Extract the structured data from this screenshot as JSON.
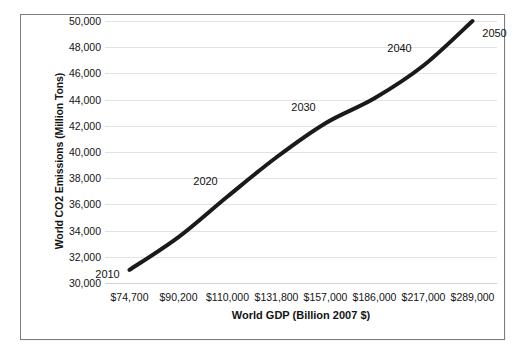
{
  "figure": {
    "background_color": "#ffffff",
    "frame_border_color": "#7d7d7d",
    "gridline_color": "#e2e2e2",
    "series_color": "#1a1a1a"
  },
  "chart_data": {
    "type": "line",
    "title": "",
    "xlabel": "World GDP (Billion 2007 $)",
    "ylabel": "World CO2 Emissions (Million Tons)",
    "x_tick_labels": [
      "$74,700",
      "$90,200",
      "$110,000",
      "$131,800",
      "$157,000",
      "$186,000",
      "$217,000",
      "$289,000"
    ],
    "x": [
      74700,
      90200,
      110000,
      131800,
      157000,
      186000,
      217000,
      289000
    ],
    "y_tick_labels": [
      "50,000",
      "48,000",
      "46,000",
      "44,000",
      "42,000",
      "40,000",
      "38,000",
      "36,000",
      "34,000",
      "32,000",
      "30,000"
    ],
    "y_ticks": [
      50000,
      48000,
      46000,
      44000,
      42000,
      40000,
      38000,
      36000,
      34000,
      32000,
      30000
    ],
    "ylim": [
      30000,
      50000
    ],
    "values": [
      31000,
      33500,
      36600,
      39600,
      42200,
      44100,
      46600,
      50000
    ],
    "point_labels": [
      {
        "text": "2010",
        "x_index": 0,
        "dx": -22,
        "dy": 4
      },
      {
        "text": "2020",
        "x_index": 2,
        "dx": -22,
        "dy": -16
      },
      {
        "text": "2030",
        "x_index": 4,
        "dx": -22,
        "dy": -16
      },
      {
        "text": "2040",
        "x_index": 6,
        "dx": -24,
        "dy": -18
      },
      {
        "text": "2050",
        "x_index": 7,
        "dx": 22,
        "dy": 12
      }
    ],
    "grid": true,
    "legend": "none",
    "line_width": 4
  }
}
